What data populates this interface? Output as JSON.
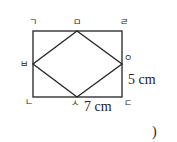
{
  "figure": {
    "vertices": {
      "top_left": "ㄱ",
      "bottom_left": "ㄴ",
      "bottom_right": "ㄷ",
      "top_right": "ㄹ",
      "top_mid": "ㅁ",
      "left_mid": "ㅂ",
      "bottom_mid": "ㅅ",
      "right_mid": "ㅇ"
    },
    "measurements": {
      "height": "5 cm",
      "half_width": "7 cm"
    }
  },
  "answer_paren": ")"
}
